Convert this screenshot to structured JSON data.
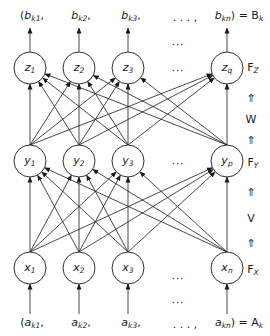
{
  "diagram": {
    "type": "three-layer neural network (BAM-style) diagram",
    "layers": {
      "output": {
        "name": "F_Z",
        "label_main": "F",
        "label_sub": "Z",
        "nodes": [
          {
            "var": "z",
            "sub": "1"
          },
          {
            "var": "z",
            "sub": "2"
          },
          {
            "var": "z",
            "sub": "3"
          },
          {
            "var": "z",
            "sub": "q"
          }
        ]
      },
      "hidden": {
        "name": "F_Y",
        "label_main": "F",
        "label_sub": "Y",
        "nodes": [
          {
            "var": "y",
            "sub": "1"
          },
          {
            "var": "y",
            "sub": "2"
          },
          {
            "var": "y",
            "sub": "3"
          },
          {
            "var": "y",
            "sub": "p"
          }
        ]
      },
      "input": {
        "name": "F_X",
        "label_main": "F",
        "label_sub": "X",
        "nodes": [
          {
            "var": "x",
            "sub": "1"
          },
          {
            "var": "x",
            "sub": "2"
          },
          {
            "var": "x",
            "sub": "3"
          },
          {
            "var": "x",
            "sub": "n"
          }
        ]
      }
    },
    "weights": {
      "upper": "W",
      "lower": "V",
      "arrow": "⇑"
    },
    "output_vector": {
      "items": [
        {
          "open": "(",
          "var": "b",
          "sub": "k1",
          "sep": ","
        },
        {
          "open": "",
          "var": "b",
          "sub": "k2",
          "sep": ","
        },
        {
          "open": "",
          "var": "b",
          "sub": "k3",
          "sep": ","
        },
        {
          "open": "",
          "var": "b",
          "sub": "kn",
          "sep": ") = "
        }
      ],
      "ellipsis": ". . . ,",
      "result_main": "B",
      "result_sub": "k"
    },
    "input_vector": {
      "items": [
        {
          "open": "(",
          "var": "a",
          "sub": "k1",
          "sep": ","
        },
        {
          "open": "",
          "var": "a",
          "sub": "k2",
          "sep": ","
        },
        {
          "open": "",
          "var": "a",
          "sub": "k3",
          "sep": ","
        },
        {
          "open": "",
          "var": "a",
          "sub": "kn",
          "sep": ") = "
        }
      ],
      "ellipsis": ". . . ,",
      "result_main": "A",
      "result_sub": "k"
    },
    "ellipsis": "···",
    "connectivity": "fully connected between adjacent layers",
    "colors": {
      "stroke": "#1a1a1a",
      "background": "#ffffff"
    }
  }
}
